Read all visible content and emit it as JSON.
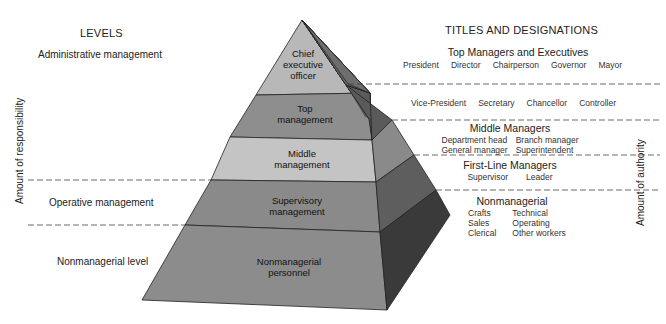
{
  "left": {
    "header": "LEVELS",
    "axis_label": "Amount of responsibility",
    "levels": [
      {
        "label": "Administrative management"
      },
      {
        "label": "Operative management"
      },
      {
        "label": "Nonmanagerial level"
      }
    ]
  },
  "right": {
    "header": "TITLES AND DESIGNATIONS",
    "axis_label": "Amount of authority",
    "groups": [
      {
        "name": "Top Managers and Executives",
        "titles": [
          "President",
          "Director",
          "Chairperson",
          "Governor",
          "Mayor"
        ]
      },
      {
        "name": "",
        "titles": [
          "Vice-President",
          "Secretary",
          "Chancellor",
          "Controller"
        ]
      },
      {
        "name": "Middle Managers",
        "titles": [
          "Department head",
          "Branch manager",
          "General manager",
          "Superintendent"
        ]
      },
      {
        "name": "First-Line Managers",
        "titles": [
          "Supervisor",
          "Leader"
        ]
      },
      {
        "name": "Nonmanagerial",
        "titles": [
          "Crafts",
          "Technical",
          "Sales",
          "Operating",
          "Clerical",
          "Other workers"
        ]
      }
    ]
  },
  "pyramid": {
    "tiers": [
      {
        "line1": "Chief",
        "line2": "executive",
        "line3": "officer",
        "front_color": "#b8b8b8",
        "side_color": "#6e6e6e"
      },
      {
        "line1": "Top",
        "line2": "management",
        "front_color": "#8e8e8e",
        "side_color": "#5a5a5a"
      },
      {
        "line1": "Middle",
        "line2": "management",
        "front_color": "#c4c4c4",
        "side_color": "#8a8a8a"
      },
      {
        "line1": "Supervisory",
        "line2": "management",
        "front_color": "#8a8a8a",
        "side_color": "#5e5e5e"
      },
      {
        "line1": "Nonmanagerial",
        "line2": "personnel",
        "front_color": "#8c8c8c",
        "side_color": "#3a3a3a"
      }
    ]
  }
}
